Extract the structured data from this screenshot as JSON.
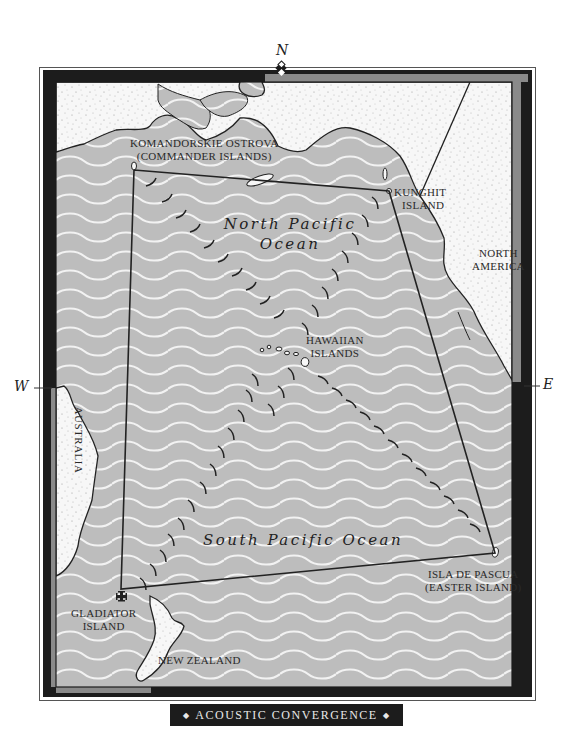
{
  "map": {
    "title": "Acoustic Convergence",
    "title_ornament": "◆",
    "colors": {
      "ocean": "#bdbdbd",
      "wave": "#f2f2f2",
      "land": "#f6f6f6",
      "frame_dark": "#1c1c1c",
      "frame_gray": "#8a8a8a",
      "route_line": "#222222"
    },
    "compass": {
      "north": "N",
      "south": "",
      "east": "E",
      "west": "W"
    },
    "oceans": [
      {
        "id": "north-pacific",
        "line1": "North Pacific",
        "line2": "Ocean"
      },
      {
        "id": "south-pacific",
        "line1": "South Pacific Ocean"
      }
    ],
    "landmasses": [
      {
        "id": "north-america",
        "line1": "North",
        "line2": "America"
      },
      {
        "id": "australia",
        "line1": "Australia"
      },
      {
        "id": "new-zealand",
        "line1": "New Zealand"
      }
    ],
    "locations": [
      {
        "id": "komandorskie",
        "line1": "Komandorskie Ostrova",
        "line2": "(Commander Islands)"
      },
      {
        "id": "kunghit",
        "line1": "Kunghit",
        "line2": "Island"
      },
      {
        "id": "hawaiian",
        "line1": "Hawaiian",
        "line2": "Islands"
      },
      {
        "id": "easter",
        "line1": "Isla de Pascua",
        "line2": "(Easter Island)"
      },
      {
        "id": "gladiator",
        "line1": "Gladiator",
        "line2": "Island",
        "marker": "cross-pattee"
      }
    ],
    "route_points": [
      {
        "id": "komandorskie",
        "x": 134,
        "y": 170
      },
      {
        "id": "kunghit",
        "x": 389,
        "y": 191
      },
      {
        "id": "easter",
        "x": 495,
        "y": 553
      },
      {
        "id": "gladiator",
        "x": 121,
        "y": 589
      }
    ]
  }
}
